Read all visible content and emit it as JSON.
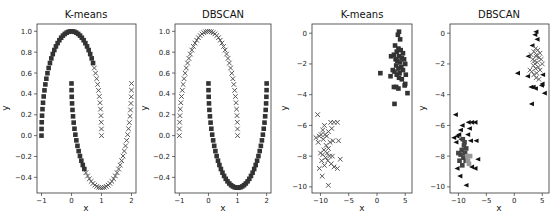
{
  "figure": {
    "width": 560,
    "height": 224,
    "background": "#ffffff"
  },
  "chart_data": [
    {
      "type": "scatter",
      "title": "K-means",
      "xlabel": "x",
      "ylabel": "y",
      "xlim": [
        -1.15,
        2.15
      ],
      "ylim": [
        -0.55,
        1.07
      ],
      "xticks": [
        -1,
        0,
        1,
        2
      ],
      "yticks": [
        -0.4,
        -0.2,
        0.0,
        0.2,
        0.4,
        0.6,
        0.8,
        1.0
      ],
      "ytick_labels": [
        "-0.4",
        "-0.2",
        "0.0",
        "0.2",
        "0.4",
        "0.6",
        "0.8",
        "1.0"
      ],
      "bbox": [
        37,
        24,
        136,
        193
      ],
      "dataset": "moons",
      "series": [
        {
          "name": "cluster 0",
          "marker": "square",
          "color": "#333333",
          "region": "outer moon left of x~0.75 + inner moon x<1.0"
        },
        {
          "name": "cluster 1",
          "marker": "x",
          "color": "#555555",
          "region": "outer moon right of x~0.75 + inner moon x>=1.0"
        }
      ]
    },
    {
      "type": "scatter",
      "title": "DBSCAN",
      "xlabel": "x",
      "ylabel": "y",
      "xlim": [
        -1.15,
        2.15
      ],
      "ylim": [
        -0.55,
        1.07
      ],
      "xticks": [
        -1,
        0,
        1,
        2
      ],
      "yticks": [
        -0.4,
        -0.2,
        0.0,
        0.2,
        0.4,
        0.6,
        0.8,
        1.0
      ],
      "ytick_labels": [
        "-0.4",
        "-0.2",
        "0.0",
        "0.2",
        "0.4",
        "0.6",
        "0.8",
        "1.0"
      ],
      "bbox": [
        175,
        24,
        271,
        193
      ],
      "dataset": "moons",
      "series": [
        {
          "name": "cluster 0 (outer moon)",
          "marker": "x",
          "color": "#555555"
        },
        {
          "name": "cluster 1 (inner moon)",
          "marker": "square",
          "color": "#333333"
        }
      ]
    },
    {
      "type": "scatter",
      "title": "K-means",
      "xlabel": "x",
      "ylabel": "y",
      "xlim": [
        -11.5,
        6.2
      ],
      "ylim": [
        -10.4,
        0.6
      ],
      "xticks": [
        -10,
        -5,
        0,
        5
      ],
      "yticks": [
        -10,
        -8,
        -6,
        -4,
        -2,
        0
      ],
      "bbox": [
        312,
        24,
        412,
        193
      ],
      "dataset": "blobs",
      "series": [
        {
          "name": "cluster 0",
          "marker": "square",
          "color": "#333333",
          "points": [
            [
              3.9,
              0.1
            ],
            [
              3.7,
              -0.1
            ],
            [
              4.1,
              -0.4
            ],
            [
              3.2,
              -0.8
            ],
            [
              3.8,
              -1.0
            ],
            [
              4.2,
              -1.1
            ],
            [
              3.5,
              -1.2
            ],
            [
              4.6,
              -1.3
            ],
            [
              3.0,
              -1.4
            ],
            [
              2.5,
              -1.5
            ],
            [
              3.9,
              -1.5
            ],
            [
              4.4,
              -1.6
            ],
            [
              3.3,
              -1.7
            ],
            [
              4.8,
              -1.7
            ],
            [
              3.6,
              -1.8
            ],
            [
              4.1,
              -1.9
            ],
            [
              5.0,
              -2.0
            ],
            [
              3.4,
              -2.1
            ],
            [
              4.3,
              -2.2
            ],
            [
              3.8,
              -2.3
            ],
            [
              2.8,
              -2.4
            ],
            [
              4.6,
              -2.4
            ],
            [
              3.1,
              -2.5
            ],
            [
              0.6,
              -2.6
            ],
            [
              4.0,
              -2.6
            ],
            [
              3.5,
              -2.7
            ],
            [
              5.1,
              -2.7
            ],
            [
              2.4,
              -2.8
            ],
            [
              3.9,
              -2.9
            ],
            [
              4.4,
              -3.0
            ],
            [
              5.0,
              -3.3
            ],
            [
              4.9,
              -3.4
            ],
            [
              3.0,
              -3.5
            ],
            [
              3.4,
              -3.5
            ],
            [
              3.8,
              -3.6
            ],
            [
              5.4,
              -3.9
            ],
            [
              3.1,
              -4.6
            ]
          ]
        },
        {
          "name": "cluster 1",
          "marker": "x",
          "color": "#555555",
          "points": [
            [
              -10.5,
              -5.3
            ],
            [
              -8.2,
              -5.8
            ],
            [
              -7.6,
              -5.8
            ],
            [
              -7.0,
              -5.8
            ],
            [
              -9.3,
              -6.0
            ],
            [
              -8.0,
              -6.2
            ],
            [
              -9.6,
              -6.3
            ],
            [
              -8.6,
              -6.4
            ],
            [
              -9.9,
              -6.6
            ],
            [
              -9.2,
              -6.6
            ],
            [
              -10.2,
              -6.7
            ],
            [
              -8.9,
              -6.7
            ],
            [
              -10.8,
              -6.8
            ],
            [
              -9.5,
              -6.9
            ],
            [
              -7.8,
              -7.0
            ],
            [
              -6.8,
              -7.0
            ],
            [
              -8.3,
              -7.1
            ],
            [
              -10.4,
              -7.1
            ],
            [
              -9.0,
              -7.3
            ],
            [
              -8.6,
              -7.5
            ],
            [
              -9.4,
              -7.6
            ],
            [
              -8.8,
              -7.8
            ],
            [
              -10.0,
              -7.8
            ],
            [
              -9.6,
              -7.9
            ],
            [
              -8.4,
              -8.0
            ],
            [
              -7.9,
              -8.0
            ],
            [
              -9.1,
              -8.1
            ],
            [
              -6.5,
              -8.2
            ],
            [
              -8.7,
              -8.3
            ],
            [
              -9.8,
              -8.3
            ],
            [
              -8.1,
              -8.5
            ],
            [
              -9.3,
              -8.6
            ],
            [
              -7.6,
              -8.7
            ],
            [
              -7.0,
              -8.8
            ],
            [
              -10.2,
              -8.8
            ],
            [
              -9.7,
              -9.3
            ],
            [
              -8.6,
              -9.9
            ]
          ]
        }
      ]
    },
    {
      "type": "scatter",
      "title": "DBSCAN",
      "xlabel": "x",
      "ylabel": "y",
      "xlim": [
        -11.5,
        6.2
      ],
      "ylim": [
        -10.4,
        0.6
      ],
      "xticks": [
        -10,
        -5,
        0,
        5
      ],
      "yticks": [
        -10,
        -8,
        -6,
        -4,
        -2,
        0
      ],
      "bbox": [
        450,
        24,
        549,
        193
      ],
      "dataset": "blobs",
      "series": [
        {
          "name": "noise",
          "marker": "triangle-left",
          "color": "#111111",
          "points": [
            [
              3.9,
              0.1
            ],
            [
              3.7,
              -0.1
            ],
            [
              4.1,
              -0.4
            ],
            [
              3.2,
              -0.8
            ],
            [
              2.5,
              -1.5
            ],
            [
              0.6,
              -2.6
            ],
            [
              5.1,
              -2.7
            ],
            [
              2.4,
              -2.8
            ],
            [
              5.0,
              -3.3
            ],
            [
              4.9,
              -3.4
            ],
            [
              3.0,
              -3.5
            ],
            [
              3.4,
              -3.5
            ],
            [
              3.8,
              -3.6
            ],
            [
              5.4,
              -3.9
            ],
            [
              3.1,
              -4.6
            ],
            [
              -10.5,
              -5.3
            ],
            [
              -8.2,
              -5.8
            ],
            [
              -7.6,
              -5.8
            ],
            [
              -7.0,
              -5.8
            ],
            [
              -9.3,
              -6.0
            ],
            [
              -8.0,
              -6.2
            ],
            [
              -9.6,
              -6.3
            ],
            [
              -9.9,
              -6.6
            ],
            [
              -10.2,
              -6.7
            ],
            [
              -10.8,
              -6.8
            ],
            [
              -6.8,
              -7.0
            ],
            [
              -7.8,
              -7.0
            ],
            [
              -10.4,
              -7.1
            ],
            [
              -6.5,
              -8.2
            ],
            [
              -7.6,
              -8.7
            ],
            [
              -7.0,
              -8.8
            ],
            [
              -10.2,
              -8.8
            ],
            [
              -9.7,
              -9.3
            ],
            [
              -8.6,
              -9.9
            ],
            [
              -9.5,
              -6.9
            ],
            [
              -8.3,
              -6.6
            ]
          ]
        },
        {
          "name": "cluster 0",
          "marker": "x",
          "color": "#666666",
          "points": [
            [
              3.8,
              -1.0
            ],
            [
              4.2,
              -1.1
            ],
            [
              3.5,
              -1.2
            ],
            [
              4.6,
              -1.3
            ],
            [
              3.0,
              -1.4
            ],
            [
              3.9,
              -1.5
            ],
            [
              4.4,
              -1.6
            ],
            [
              3.3,
              -1.7
            ],
            [
              4.8,
              -1.7
            ],
            [
              3.6,
              -1.8
            ],
            [
              4.1,
              -1.9
            ],
            [
              5.0,
              -2.0
            ],
            [
              3.4,
              -2.1
            ],
            [
              4.3,
              -2.2
            ],
            [
              3.8,
              -2.3
            ],
            [
              2.8,
              -2.4
            ],
            [
              4.6,
              -2.4
            ],
            [
              3.1,
              -2.5
            ],
            [
              4.0,
              -2.6
            ],
            [
              3.5,
              -2.7
            ],
            [
              3.9,
              -2.9
            ],
            [
              4.4,
              -3.0
            ],
            [
              3.7,
              -2.0
            ],
            [
              4.0,
              -1.4
            ]
          ]
        },
        {
          "name": "cluster 1",
          "marker": "square",
          "color": "#444444",
          "points": [
            [
              -9.0,
              -7.3
            ],
            [
              -8.6,
              -7.5
            ],
            [
              -9.4,
              -7.6
            ],
            [
              -8.8,
              -7.8
            ],
            [
              -10.0,
              -7.8
            ],
            [
              -9.6,
              -7.9
            ],
            [
              -9.1,
              -8.1
            ],
            [
              -9.8,
              -8.3
            ],
            [
              -9.3,
              -8.6
            ],
            [
              -8.9,
              -7.1
            ],
            [
              -9.2,
              -6.9
            ],
            [
              -8.7,
              -8.3
            ]
          ]
        },
        {
          "name": "cluster 2",
          "marker": "square",
          "color": "#999999",
          "points": [
            [
              -8.4,
              -8.0
            ],
            [
              -7.9,
              -8.0
            ],
            [
              -8.1,
              -8.5
            ],
            [
              -8.3,
              -8.3
            ]
          ]
        }
      ]
    }
  ]
}
